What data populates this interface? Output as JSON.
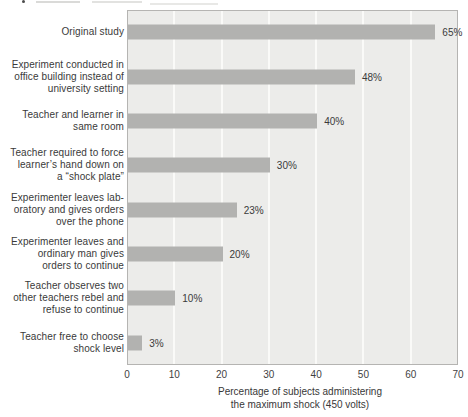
{
  "chart_data": {
    "type": "bar",
    "orientation": "horizontal",
    "title": "",
    "xlabel": "Percentage of subjects administering the maximum shock (450 volts)",
    "xlabel_lines": [
      "Percentage of subjects administering",
      "the maximum shock (450 volts)"
    ],
    "xlim": [
      0,
      70
    ],
    "xticks": [
      0,
      10,
      20,
      30,
      40,
      50,
      60,
      70
    ],
    "grid": "vertical-white-gridlines-at-each-tick",
    "legend": "none",
    "bars": [
      {
        "label": "Original study",
        "label_lines": [
          "Original study"
        ],
        "value": 65,
        "value_label": "65%"
      },
      {
        "label": "Experiment conducted in office building instead of university setting",
        "label_lines": [
          "Experiment conducted in",
          "office building instead of",
          "university setting"
        ],
        "value": 48,
        "value_label": "48%"
      },
      {
        "label": "Teacher and learner in same room",
        "label_lines": [
          "Teacher and learner in",
          "same room"
        ],
        "value": 40,
        "value_label": "40%"
      },
      {
        "label": "Teacher required to force learner’s hand down on a “shock plate”",
        "label_lines": [
          "Teacher required to force",
          "learner’s hand down on",
          "a “shock plate”"
        ],
        "value": 30,
        "value_label": "30%"
      },
      {
        "label": "Experimenter leaves laboratory and gives orders over the phone",
        "label_lines": [
          "Experimenter leaves lab-",
          "oratory and gives orders",
          "over the phone"
        ],
        "value": 23,
        "value_label": "23%"
      },
      {
        "label": "Experimenter leaves and ordinary man gives orders to continue",
        "label_lines": [
          "Experimenter leaves and",
          "ordinary man gives",
          "orders to continue"
        ],
        "value": 20,
        "value_label": "20%"
      },
      {
        "label": "Teacher observes two other teachers rebel and refuse to continue",
        "label_lines": [
          "Teacher observes two",
          "other teachers rebel and",
          "refuse to continue"
        ],
        "value": 10,
        "value_label": "10%"
      },
      {
        "label": "Teacher free to choose shock level",
        "label_lines": [
          "Teacher free to choose",
          "shock level"
        ],
        "value": 3,
        "value_label": "3%"
      }
    ],
    "colors": {
      "bar": "#b2b2b0",
      "plot_background": "#ececea",
      "plot_border": "#b5b4b2",
      "gridline": "#fafaf8",
      "text": "#3a3a3a",
      "page_background": "#ffffff"
    }
  }
}
